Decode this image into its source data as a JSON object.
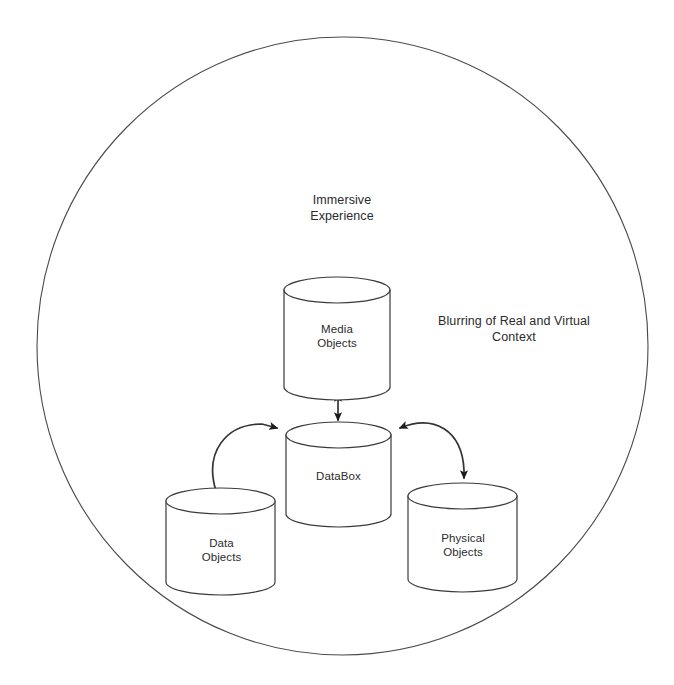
{
  "diagram": {
    "title_context_labels": [
      {
        "name": "immersive-experience-label",
        "text": "Immersive\nExperience",
        "x": 342,
        "y": 209
      },
      {
        "name": "blurring-label",
        "text": "Blurring of Real and Virtual\nContext",
        "x": 514,
        "y": 330
      }
    ],
    "boundary": {
      "name": "immersive-experience-boundary",
      "shape": "circle",
      "cx": 342.5,
      "cy": 346,
      "rx": 305.5,
      "ry": 309,
      "stroke": "#4a4a4a",
      "stroke_width": 1.1,
      "fill": "none"
    },
    "nodes": [
      {
        "name": "media-objects-node",
        "label": "Media\nObjects",
        "shape": "cylinder",
        "x": 284,
        "y": 277,
        "width": 106,
        "height": 123,
        "ellipse_ry": 13,
        "label_x": 337,
        "label_y": 336
      },
      {
        "name": "databox-node",
        "label": "DataBox",
        "shape": "cylinder",
        "x": 286,
        "y": 422,
        "width": 105,
        "height": 105,
        "ellipse_ry": 13,
        "label_x": 338.5,
        "label_y": 476
      },
      {
        "name": "data-objects-node",
        "label": "Data\nObjects",
        "shape": "cylinder",
        "x": 166,
        "y": 488,
        "width": 109,
        "height": 107,
        "ellipse_ry": 13,
        "label_x": 221.5,
        "label_y": 550
      },
      {
        "name": "physical-objects-node",
        "label": "Physical\nObjects",
        "shape": "cylinder",
        "x": 408,
        "y": 483,
        "width": 109,
        "height": 109,
        "ellipse_ry": 13,
        "label_x": 463,
        "label_y": 545
      }
    ],
    "connectors": [
      {
        "name": "media-databox-connector",
        "from": "media-objects-node",
        "to": "databox-node",
        "style": "straight",
        "arrowheads": "both",
        "path": "M 338 394 L 338 420"
      },
      {
        "name": "data-objects-databox-connector",
        "from": "data-objects-node",
        "to": "databox-node",
        "style": "curved",
        "arrowheads": "end",
        "path": "M 216 491 C 204 452 226 424 262 424 L 277 428"
      },
      {
        "name": "databox-physical-objects-connector",
        "from": "databox-node",
        "to": "physical-objects-node",
        "style": "curved",
        "arrowheads": "both",
        "path": "M 400 428 C 434 414 462 430 464 470 L 464 478"
      }
    ],
    "style": {
      "stroke": "#333333",
      "node_stroke": "#3a3a3a",
      "node_fill": "#ffffff",
      "text_color": "#2b2b2b",
      "background": "#ffffff"
    }
  }
}
